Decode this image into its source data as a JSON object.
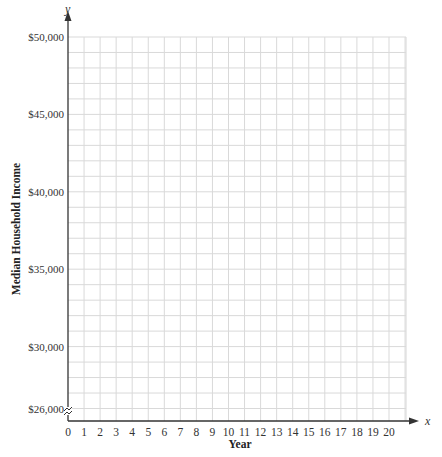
{
  "chart_data": {
    "type": "line",
    "title": "",
    "xlabel": "Year",
    "ylabel": "Median Household Income",
    "x_axis_variable": "x",
    "y_axis_variable": "y",
    "x_ticks": [
      "0",
      "1",
      "2",
      "3",
      "4",
      "5",
      "6",
      "7",
      "8",
      "9",
      "10",
      "11",
      "12",
      "13",
      "14",
      "15",
      "16",
      "17",
      "18",
      "19",
      "20"
    ],
    "y_ticks": [
      "$26,000",
      "$30,000",
      "$35,000",
      "$40,000",
      "$45,000",
      "$50,000"
    ],
    "xlim": [
      0,
      21
    ],
    "ylim": [
      25000,
      50000
    ],
    "y_axis_break": true,
    "grid": true,
    "grid_spacing": {
      "x": 1,
      "y": 1000
    },
    "series": []
  },
  "colors": {
    "grid": "#d9d9d9",
    "axis": "#333333"
  }
}
